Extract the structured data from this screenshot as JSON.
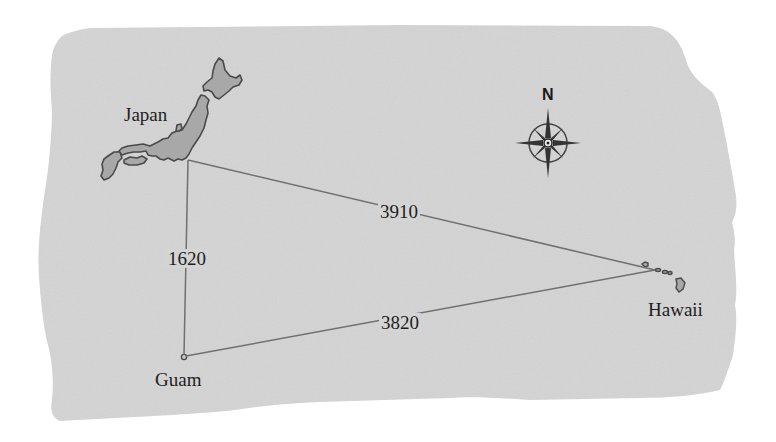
{
  "map": {
    "title": "Japan – Guam – Hawaii distance triangle",
    "background_color": "#d4d4d4",
    "land_color": "#a9a9a9",
    "line_color": "#6e6e6e",
    "places": [
      {
        "id": "japan",
        "label": "Japan",
        "x": 188,
        "y": 160
      },
      {
        "id": "guam",
        "label": "Guam",
        "x": 184,
        "y": 357
      },
      {
        "id": "hawaii",
        "label": "Hawaii",
        "x": 655,
        "y": 270
      }
    ],
    "routes": [
      {
        "from": "japan",
        "to": "hawaii",
        "distance": "3910"
      },
      {
        "from": "japan",
        "to": "guam",
        "distance": "1620"
      },
      {
        "from": "guam",
        "to": "hawaii",
        "distance": "3820"
      }
    ],
    "compass": {
      "label": "N",
      "icon": "compass-rose-icon"
    }
  }
}
